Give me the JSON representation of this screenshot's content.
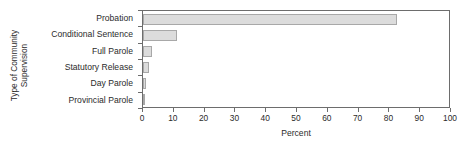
{
  "chart_data": {
    "type": "bar",
    "orientation": "horizontal",
    "title": "",
    "xlabel": "Percent",
    "ylabel": "Type of Community Supervision",
    "ylabel_lines": [
      "Type of Community",
      "Supervision"
    ],
    "categories": [
      "Probation",
      "Conditional Sentence",
      "Full Parole",
      "Statutory Release",
      "Day Parole",
      "Provincial Parole"
    ],
    "values": [
      83,
      11,
      3,
      2,
      1,
      0.5
    ],
    "xlim": [
      0,
      100
    ],
    "xticks": [
      0,
      10,
      20,
      30,
      40,
      50,
      60,
      70,
      80,
      90,
      100
    ],
    "xtick_labels": [
      "0",
      "10",
      "20",
      "30",
      "40",
      "50",
      "60",
      "70",
      "80",
      "90",
      "100"
    ],
    "grid": false,
    "legend": false,
    "bar_fill_color": "#dcdcdc",
    "bar_edge_color": "#a8a8a8",
    "axis_color": "#6d6d6d",
    "text_color": "#2b2b2b",
    "background_color": "#ffffff"
  }
}
